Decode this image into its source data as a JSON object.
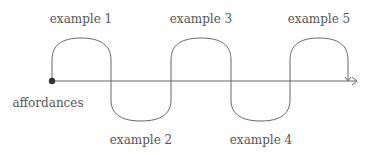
{
  "diagram": {
    "start_label": "affordances",
    "examples": [
      {
        "label": "example 1",
        "position": "above"
      },
      {
        "label": "example 2",
        "position": "below"
      },
      {
        "label": "example 3",
        "position": "above"
      },
      {
        "label": "example 4",
        "position": "below"
      },
      {
        "label": "example 5",
        "position": "above"
      }
    ],
    "colors": {
      "line": "#555555",
      "text": "#555555",
      "dot": "#333333"
    }
  }
}
